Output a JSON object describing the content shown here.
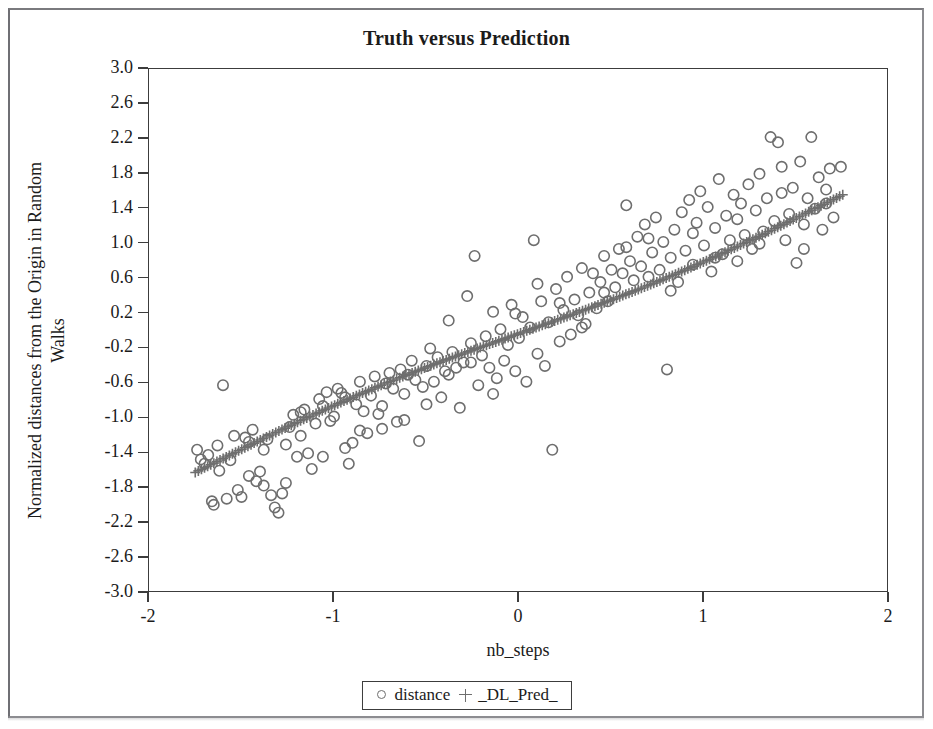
{
  "figure": {
    "title": "Truth versus Prediction",
    "border_color": "#8c8c90"
  },
  "axes": {
    "x_label": "nb_steps",
    "y_label_line1": "Normalized distances from the Origin in Random",
    "y_label_line2": "Walks",
    "x_ticks": [
      "-2",
      "-1",
      "0",
      "1",
      "2"
    ],
    "y_ticks": [
      "3.0",
      "2.6",
      "2.2",
      "1.8",
      "1.4",
      "1.0",
      "0.6",
      "0.2",
      "-0.2",
      "-0.6",
      "-1.0",
      "-1.4",
      "-1.8",
      "-2.2",
      "-2.6",
      "-3.0"
    ]
  },
  "legend": {
    "entries": [
      {
        "symbol": "circle",
        "label": "distance"
      },
      {
        "symbol": "plus",
        "label": "_DL_Pred_"
      }
    ]
  },
  "colors": {
    "marker": "#6e6e6e",
    "axis": "#3c3c3c",
    "text": "#1b1b1b",
    "background": "#ffffff"
  },
  "chart_data": {
    "type": "scatter",
    "title": "Truth versus Prediction",
    "xlabel": "nb_steps",
    "ylabel": "Normalized distances from the Origin in Random Walks",
    "xlim": [
      -2,
      2
    ],
    "ylim": [
      -3.0,
      3.0
    ],
    "x_ticks": [
      -2,
      -1,
      0,
      1,
      2
    ],
    "y_ticks": [
      3.0,
      2.6,
      2.2,
      1.8,
      1.4,
      1.0,
      0.6,
      0.2,
      -0.2,
      -0.6,
      -1.0,
      -1.4,
      -1.8,
      -2.2,
      -2.6,
      -3.0
    ],
    "grid": false,
    "legend_position": "below-axes",
    "series": [
      {
        "name": "distance",
        "marker": "circle",
        "color": "#6e6e6e",
        "points": [
          [
            -1.74,
            -1.36
          ],
          [
            -1.72,
            -1.47
          ],
          [
            -1.7,
            -1.52
          ],
          [
            -1.68,
            -1.42
          ],
          [
            -1.66,
            -1.95
          ],
          [
            -1.65,
            -1.99
          ],
          [
            -1.63,
            -1.31
          ],
          [
            -1.62,
            -1.6
          ],
          [
            -1.6,
            -0.62
          ],
          [
            -1.58,
            -1.92
          ],
          [
            -1.56,
            -1.48
          ],
          [
            -1.54,
            -1.2
          ],
          [
            -1.52,
            -1.82
          ],
          [
            -1.5,
            -1.9
          ],
          [
            -1.48,
            -1.22
          ],
          [
            -1.46,
            -1.27
          ],
          [
            -1.44,
            -1.13
          ],
          [
            -1.42,
            -1.72
          ],
          [
            -1.4,
            -1.61
          ],
          [
            -1.38,
            -1.77
          ],
          [
            -1.36,
            -1.24
          ],
          [
            -1.34,
            -1.88
          ],
          [
            -1.32,
            -2.02
          ],
          [
            -1.3,
            -2.08
          ],
          [
            -1.28,
            -1.86
          ],
          [
            -1.26,
            -1.3
          ],
          [
            -1.24,
            -1.1
          ],
          [
            -1.22,
            -0.96
          ],
          [
            -1.2,
            -1.44
          ],
          [
            -1.18,
            -0.93
          ],
          [
            -1.16,
            -0.9
          ],
          [
            -1.14,
            -1.4
          ],
          [
            -1.12,
            -1.58
          ],
          [
            -1.1,
            -1.06
          ],
          [
            -1.08,
            -0.78
          ],
          [
            -1.06,
            -0.86
          ],
          [
            -1.04,
            -0.7
          ],
          [
            -1.02,
            -1.03
          ],
          [
            -1.0,
            -0.98
          ],
          [
            -0.98,
            -0.66
          ],
          [
            -0.96,
            -0.71
          ],
          [
            -0.94,
            -1.34
          ],
          [
            -0.92,
            -1.52
          ],
          [
            -0.9,
            -1.28
          ],
          [
            -0.88,
            -0.84
          ],
          [
            -0.86,
            -0.58
          ],
          [
            -0.84,
            -0.92
          ],
          [
            -0.82,
            -1.17
          ],
          [
            -0.8,
            -0.74
          ],
          [
            -0.78,
            -0.52
          ],
          [
            -0.76,
            -0.95
          ],
          [
            -0.74,
            -1.12
          ],
          [
            -0.72,
            -0.6
          ],
          [
            -0.7,
            -0.48
          ],
          [
            -0.68,
            -0.66
          ],
          [
            -0.66,
            -1.04
          ],
          [
            -0.64,
            -0.44
          ],
          [
            -0.62,
            -0.72
          ],
          [
            -0.6,
            -0.5
          ],
          [
            -0.58,
            -0.34
          ],
          [
            -0.56,
            -0.56
          ],
          [
            -0.54,
            -1.26
          ],
          [
            -0.52,
            -0.64
          ],
          [
            -0.5,
            -0.4
          ],
          [
            -0.48,
            -0.2
          ],
          [
            -0.46,
            -0.58
          ],
          [
            -0.44,
            -0.3
          ],
          [
            -0.42,
            -0.76
          ],
          [
            -0.4,
            -0.46
          ],
          [
            -0.38,
            0.12
          ],
          [
            -0.36,
            -0.24
          ],
          [
            -0.34,
            -0.42
          ],
          [
            -0.32,
            -0.88
          ],
          [
            -0.3,
            -0.36
          ],
          [
            -0.28,
            0.4
          ],
          [
            -0.26,
            -0.14
          ],
          [
            -0.24,
            0.86
          ],
          [
            -0.22,
            -0.62
          ],
          [
            -0.2,
            -0.28
          ],
          [
            -0.18,
            -0.06
          ],
          [
            -0.16,
            -0.42
          ],
          [
            -0.14,
            0.22
          ],
          [
            -0.12,
            -0.54
          ],
          [
            -0.1,
            0.02
          ],
          [
            -0.08,
            -0.34
          ],
          [
            -0.06,
            -0.16
          ],
          [
            -0.04,
            0.3
          ],
          [
            -0.02,
            -0.46
          ],
          [
            0.0,
            -0.08
          ],
          [
            0.02,
            0.16
          ],
          [
            0.04,
            -0.58
          ],
          [
            0.06,
            0.04
          ],
          [
            0.08,
            1.04
          ],
          [
            0.1,
            -0.26
          ],
          [
            0.12,
            0.34
          ],
          [
            0.14,
            -0.4
          ],
          [
            0.16,
            0.1
          ],
          [
            0.18,
            -1.36
          ],
          [
            0.2,
            0.48
          ],
          [
            0.22,
            -0.12
          ],
          [
            0.24,
            0.24
          ],
          [
            0.26,
            0.62
          ],
          [
            0.28,
            -0.04
          ],
          [
            0.3,
            0.36
          ],
          [
            0.32,
            0.18
          ],
          [
            0.34,
            0.72
          ],
          [
            0.36,
            0.08
          ],
          [
            0.38,
            0.44
          ],
          [
            0.4,
            0.66
          ],
          [
            0.42,
            0.26
          ],
          [
            0.44,
            0.56
          ],
          [
            0.46,
            0.86
          ],
          [
            0.48,
            0.34
          ],
          [
            0.5,
            0.7
          ],
          [
            0.52,
            0.5
          ],
          [
            0.54,
            0.94
          ],
          [
            0.56,
            0.66
          ],
          [
            0.58,
            1.44
          ],
          [
            0.6,
            0.8
          ],
          [
            0.62,
            0.58
          ],
          [
            0.64,
            1.08
          ],
          [
            0.66,
            0.74
          ],
          [
            0.68,
            1.22
          ],
          [
            0.7,
            0.62
          ],
          [
            0.72,
            0.9
          ],
          [
            0.74,
            1.3
          ],
          [
            0.76,
            0.7
          ],
          [
            0.78,
            1.02
          ],
          [
            0.8,
            -0.44
          ],
          [
            0.82,
            0.84
          ],
          [
            0.84,
            1.16
          ],
          [
            0.86,
            0.56
          ],
          [
            0.88,
            1.36
          ],
          [
            0.9,
            0.92
          ],
          [
            0.92,
            1.5
          ],
          [
            0.94,
            0.76
          ],
          [
            0.96,
            1.24
          ],
          [
            0.98,
            1.6
          ],
          [
            1.0,
            0.98
          ],
          [
            1.02,
            1.42
          ],
          [
            1.04,
            0.68
          ],
          [
            1.06,
            1.18
          ],
          [
            1.08,
            1.74
          ],
          [
            1.1,
            0.88
          ],
          [
            1.12,
            1.32
          ],
          [
            1.14,
            1.04
          ],
          [
            1.16,
            1.56
          ],
          [
            1.18,
            0.8
          ],
          [
            1.2,
            1.46
          ],
          [
            1.22,
            1.1
          ],
          [
            1.24,
            1.68
          ],
          [
            1.26,
            0.94
          ],
          [
            1.28,
            1.38
          ],
          [
            1.3,
            1.8
          ],
          [
            1.32,
            1.14
          ],
          [
            1.34,
            1.52
          ],
          [
            1.36,
            2.22
          ],
          [
            1.38,
            1.26
          ],
          [
            1.4,
            2.16
          ],
          [
            1.42,
            1.88
          ],
          [
            1.44,
            1.04
          ],
          [
            1.46,
            1.34
          ],
          [
            1.48,
            1.64
          ],
          [
            1.5,
            0.78
          ],
          [
            1.52,
            1.94
          ],
          [
            1.54,
            1.22
          ],
          [
            1.56,
            1.52
          ],
          [
            1.58,
            2.22
          ],
          [
            1.6,
            1.4
          ],
          [
            1.62,
            1.76
          ],
          [
            1.64,
            1.16
          ],
          [
            1.66,
            1.46
          ],
          [
            1.68,
            1.86
          ],
          [
            1.7,
            1.3
          ],
          [
            1.74,
            1.88
          ],
          [
            -1.46,
            -1.66
          ],
          [
            -1.38,
            -1.36
          ],
          [
            -1.26,
            -1.74
          ],
          [
            -1.18,
            -1.2
          ],
          [
            -1.06,
            -1.44
          ],
          [
            -0.94,
            -0.76
          ],
          [
            -0.86,
            -1.14
          ],
          [
            -0.74,
            -0.86
          ],
          [
            -0.62,
            -1.02
          ],
          [
            -0.5,
            -0.84
          ],
          [
            -0.38,
            -0.5
          ],
          [
            -0.26,
            -0.36
          ],
          [
            -0.14,
            -0.72
          ],
          [
            -0.02,
            0.2
          ],
          [
            0.1,
            0.54
          ],
          [
            0.22,
            0.32
          ],
          [
            0.34,
            0.04
          ],
          [
            0.46,
            0.44
          ],
          [
            0.58,
            0.96
          ],
          [
            0.7,
            1.06
          ],
          [
            0.82,
            0.46
          ],
          [
            0.94,
            1.12
          ],
          [
            1.06,
            0.84
          ],
          [
            1.18,
            1.28
          ],
          [
            1.3,
            1.0
          ],
          [
            1.42,
            1.58
          ],
          [
            1.54,
            0.94
          ],
          [
            1.66,
            1.62
          ]
        ]
      },
      {
        "name": "_DL_Pred_",
        "marker": "plus",
        "color": "#6e6e6e",
        "description": "Dense monotone increasing prediction trail running from about (-1.75, -1.62) to (1.75, 1.56)",
        "fit": {
          "type": "monotone",
          "x_start": -1.75,
          "x_end": 1.75,
          "y_start": -1.62,
          "y_end": 1.56,
          "n": 210
        }
      }
    ]
  }
}
